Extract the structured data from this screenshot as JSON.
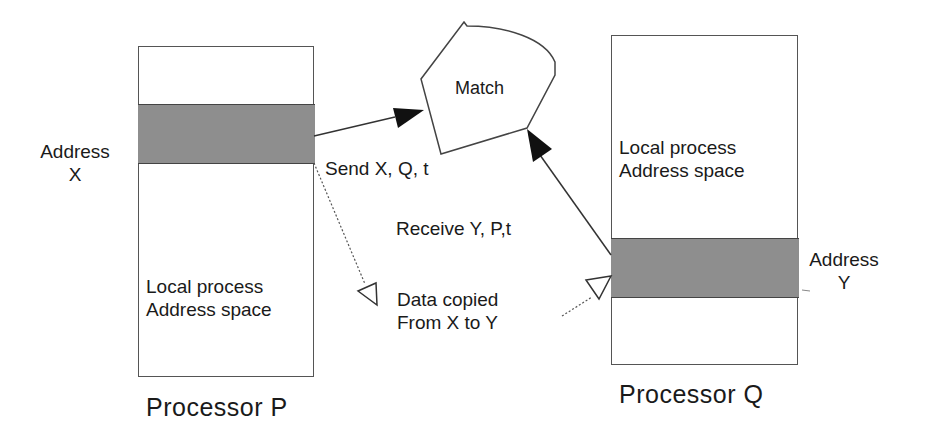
{
  "diagram": {
    "processor_p": {
      "caption": "Processor P",
      "address_label_line1": "Address",
      "address_label_line2": "X",
      "space_label_line1": "Local process",
      "space_label_line2": "Address space"
    },
    "processor_q": {
      "caption": "Processor Q",
      "address_label_line1": "Address",
      "address_label_line2": "Y",
      "space_label_line1": "Local process",
      "space_label_line2": "Address space"
    },
    "match_node": {
      "label": "Match"
    },
    "edges": {
      "send": {
        "label": "Send X, Q, t",
        "style": "solid",
        "from": "Address X",
        "to": "Match"
      },
      "receive": {
        "label": "Receive Y, P,t",
        "style": "solid",
        "from": "Address Y",
        "to": "Match"
      },
      "copy": {
        "label_line1": "Data copied",
        "label_line2": "From X to Y",
        "style": "dotted"
      }
    },
    "colors": {
      "band": "#8e8e8e",
      "outline": "#555555",
      "text": "#1a1a1a"
    }
  }
}
